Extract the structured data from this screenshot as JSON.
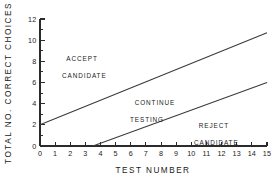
{
  "chart_data": {
    "type": "line",
    "title": "",
    "xlabel": "TEST NUMBER",
    "ylabel": "TOTAL  NO.  CORRECT  CHOICES",
    "xlim": [
      0,
      15
    ],
    "ylim": [
      0,
      12
    ],
    "grid": false,
    "legend_position": "none",
    "x_ticks": [
      0,
      1,
      2,
      3,
      4,
      5,
      6,
      7,
      8,
      9,
      10,
      11,
      12,
      13,
      14,
      15
    ],
    "x_tick_labels": [
      "0",
      "1",
      "2",
      "3",
      "4",
      "5",
      "6",
      "7",
      "8",
      "9",
      "10",
      "11",
      "12",
      "13",
      "14",
      "15"
    ],
    "y_ticks": [
      0,
      2,
      4,
      6,
      8,
      10,
      12
    ],
    "y_tick_labels": [
      "0",
      "2",
      "4",
      "6",
      "8",
      "10",
      "12"
    ],
    "y_minor_ticks": [
      1,
      3,
      5,
      7,
      9,
      11
    ],
    "series": [
      {
        "name": "accept-boundary",
        "x": [
          0,
          15
        ],
        "values": [
          2.0,
          10.7
        ],
        "slope": 0.58,
        "intercept": 2.0
      },
      {
        "name": "reject-boundary",
        "x": [
          3.5,
          15
        ],
        "values": [
          0.0,
          6.0
        ],
        "slope": 0.522,
        "intercept": -1.83
      }
    ],
    "annotations": [
      {
        "id": "accept",
        "line1": "ACCEPT",
        "line2": "CANDIDATE",
        "x": 2.4,
        "y": 8.6
      },
      {
        "id": "continue",
        "line1": "CONTINUE",
        "line2": "TESTING",
        "x": 7.2,
        "y": 4.4
      },
      {
        "id": "reject",
        "line1": "REJECT",
        "line2": "CANDIDATE",
        "x": 11.0,
        "y": 2.4
      }
    ]
  },
  "colors": {
    "background": "#ffffff",
    "axis": "#2b2b2b",
    "line": "#3a3a3a",
    "text": "#1a1a1a"
  }
}
